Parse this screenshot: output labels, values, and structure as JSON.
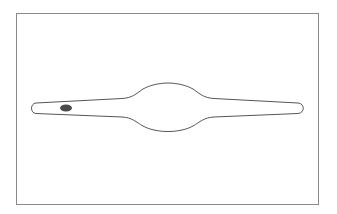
{
  "diagram": {
    "colors": {
      "background": "#ffffff",
      "frame": "#8a8a8a",
      "outline": "#555555",
      "spot": "#4a4a4a"
    },
    "frame": {
      "x": 16,
      "y": 13,
      "width": 303,
      "height": 192
    },
    "shape": {
      "left_tip": [
        33,
        108
      ],
      "right_tip": [
        303,
        108
      ],
      "bulge_center": [
        168,
        107
      ],
      "bulge_top_y": 83,
      "bulge_bottom_y": 131
    },
    "spot": {
      "cx": 66,
      "cy": 108,
      "rx": 6,
      "ry": 3.5
    }
  }
}
